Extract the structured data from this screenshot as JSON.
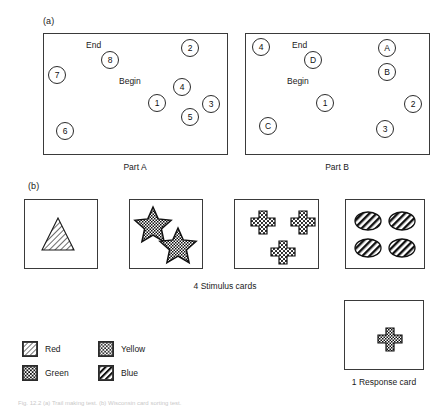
{
  "figure": {
    "panel_a_label": "(a)",
    "panel_b_label": "(b)",
    "part_a_caption": "Part A",
    "part_b_caption": "Part B",
    "stimulus_caption": "4 Stimulus cards",
    "response_caption": "1 Response card",
    "bottom_caption": "Fig. 12.2  (a) Trail making test. (b) Wisconsin card sorting test."
  },
  "part_a": {
    "begin_label": "Begin",
    "end_label": "End",
    "nodes": [
      {
        "label": "7",
        "x": 48,
        "y": 66
      },
      {
        "label": "8",
        "x": 101,
        "y": 51
      },
      {
        "label": "2",
        "x": 181,
        "y": 39
      },
      {
        "label": "4",
        "x": 173,
        "y": 78
      },
      {
        "label": "1",
        "x": 148,
        "y": 94
      },
      {
        "label": "3",
        "x": 202,
        "y": 95
      },
      {
        "label": "5",
        "x": 181,
        "y": 108
      },
      {
        "label": "6",
        "x": 56,
        "y": 122
      }
    ]
  },
  "part_b": {
    "begin_label": "Begin",
    "end_label": "End",
    "nodes": [
      {
        "label": "4",
        "x": 252,
        "y": 38
      },
      {
        "label": "D",
        "x": 304,
        "y": 51
      },
      {
        "label": "A",
        "x": 378,
        "y": 39
      },
      {
        "label": "B",
        "x": 378,
        "y": 63
      },
      {
        "label": "1",
        "x": 316,
        "y": 94
      },
      {
        "label": "2",
        "x": 404,
        "y": 95
      },
      {
        "label": "C",
        "x": 259,
        "y": 117
      },
      {
        "label": "3",
        "x": 376,
        "y": 120
      }
    ]
  },
  "stimulus_cards": [
    {
      "name": "card-one-triangle",
      "shape": "triangle",
      "count": 1,
      "color": "Blue"
    },
    {
      "name": "card-two-stars",
      "shape": "star",
      "count": 2,
      "color": "Green"
    },
    {
      "name": "card-three-crosses",
      "shape": "cross",
      "count": 3,
      "color": "Yellow"
    },
    {
      "name": "card-four-ellipses",
      "shape": "ellipse",
      "count": 4,
      "color": "Blue"
    }
  ],
  "response_card": {
    "shape": "cross",
    "count": 1,
    "color": "Green"
  },
  "legend": {
    "items": [
      {
        "label": "Red",
        "pattern": "diagonal-light"
      },
      {
        "label": "Yellow",
        "pattern": "dotted"
      },
      {
        "label": "Green",
        "pattern": "checker"
      },
      {
        "label": "Blue",
        "pattern": "diagonal-bold"
      }
    ]
  }
}
